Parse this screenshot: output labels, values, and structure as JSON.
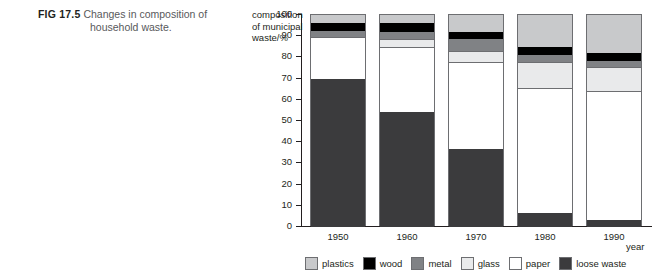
{
  "figure": {
    "number": "FIG 17.5",
    "caption_line1": "Changes in composition of",
    "caption_line2": "household waste."
  },
  "axes": {
    "y_title_line1": "composition",
    "y_title_line2": "of municipal",
    "y_title_line3": "waste/%",
    "x_title": "year",
    "y_ticks": [
      "100",
      "90",
      "80",
      "70",
      "60",
      "50",
      "40",
      "30",
      "20",
      "10",
      "0"
    ],
    "x_ticks": [
      "1950",
      "1960",
      "1970",
      "1980",
      "1990"
    ]
  },
  "colors": {
    "plastics": "#c8c9cb",
    "wood": "#000000",
    "metal": "#808285",
    "glass": "#e9eaeb",
    "paper": "#ffffff",
    "loose_waste": "#3b3b3d",
    "outline": "#6d6e71",
    "text": "#231f20",
    "caption_text": "#58595b"
  },
  "chart_data": {
    "type": "bar",
    "title": "Changes in composition of household waste.",
    "xlabel": "year",
    "ylabel": "composition of municipal waste/%",
    "ylim": [
      0,
      100
    ],
    "stacked": true,
    "grid": false,
    "legend_position": "bottom",
    "categories": [
      "1950",
      "1960",
      "1970",
      "1980",
      "1990"
    ],
    "series": [
      {
        "name": "plastics",
        "color": "#c8c9cb",
        "values": [
          4,
          4,
          8,
          15,
          18
        ]
      },
      {
        "name": "wood",
        "color": "#000000",
        "values": [
          3.5,
          4,
          3.5,
          4,
          3.5
        ]
      },
      {
        "name": "metal",
        "color": "#808285",
        "values": [
          3,
          3.5,
          5.5,
          3,
          3
        ]
      },
      {
        "name": "glass",
        "color": "#e9eaeb",
        "values": [
          0,
          3.5,
          5,
          12.5,
          11.5
        ]
      },
      {
        "name": "paper",
        "color": "#ffffff",
        "values": [
          19.5,
          31,
          41,
          59,
          60.5
        ]
      },
      {
        "name": "loose waste",
        "color": "#3b3b3d",
        "values": [
          70,
          54,
          37,
          6.5,
          3.5
        ]
      }
    ],
    "cumulative_tops": {
      "1950": {
        "loose waste": 70,
        "paper": 89.5,
        "glass": 89.5,
        "metal": 92.5,
        "wood": 96,
        "plastics": 100
      },
      "1960": {
        "loose waste": 54,
        "paper": 85,
        "glass": 88.5,
        "metal": 92,
        "wood": 96,
        "plastics": 100
      },
      "1970": {
        "loose waste": 37,
        "paper": 78,
        "glass": 83,
        "metal": 88.5,
        "wood": 92,
        "plastics": 100
      },
      "1980": {
        "loose waste": 6.5,
        "paper": 65.5,
        "glass": 78,
        "metal": 81,
        "wood": 85,
        "plastics": 100
      },
      "1990": {
        "loose waste": 3.5,
        "paper": 64,
        "glass": 75.5,
        "metal": 78.5,
        "wood": 82,
        "plastics": 100
      }
    }
  },
  "legend": {
    "items": [
      {
        "label": "plastics",
        "color": "#c8c9cb"
      },
      {
        "label": "wood",
        "color": "#000000"
      },
      {
        "label": "metal",
        "color": "#808285"
      },
      {
        "label": "glass",
        "color": "#e9eaeb"
      },
      {
        "label": "paper",
        "color": "#ffffff"
      },
      {
        "label": "loose waste",
        "color": "#3b3b3d"
      }
    ]
  }
}
